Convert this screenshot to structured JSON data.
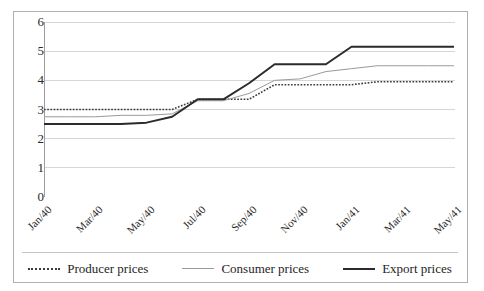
{
  "figure": {
    "top_clipped_text": "",
    "background": "#ffffff",
    "border_color": "#b0b0b0"
  },
  "legend": {
    "position": "bottom",
    "items": [
      {
        "label": "Producer prices",
        "style": "dotted",
        "color": "#3b3b3b",
        "swatch": "line-swatch-dotted"
      },
      {
        "label": "Consumer prices",
        "style": "thin-solid",
        "color": "#9a9a9a",
        "swatch": "line-swatch-thin"
      },
      {
        "label": "Export prices",
        "style": "thick-solid",
        "color": "#2b2b2b",
        "swatch": "line-swatch-thick"
      }
    ]
  },
  "axes": {
    "y_ticks": [
      "6",
      "5",
      "4",
      "3",
      "2",
      "1",
      "0"
    ],
    "x_ticks": [
      "Jan/40",
      "Mar/40",
      "May/40",
      "Jul/40",
      "Sep/40",
      "Nov/40",
      "Jan/41",
      "Mar/41",
      "May/41"
    ]
  },
  "chart_data": {
    "type": "line",
    "title": "",
    "xlabel": "",
    "ylabel": "",
    "ylim": [
      0,
      6
    ],
    "ytick_step": 1,
    "grid": true,
    "grid_axis": "y",
    "legend_position": "bottom",
    "x": [
      "Jan/40",
      "Feb/40",
      "Mar/40",
      "Apr/40",
      "May/40",
      "Jun/40",
      "Jul/40",
      "Aug/40",
      "Sep/40",
      "Oct/40",
      "Nov/40",
      "Dec/40",
      "Jan/41",
      "Feb/41",
      "Mar/41",
      "Apr/41",
      "May/41"
    ],
    "x_tick_labels": [
      "Jan/40",
      "Mar/40",
      "May/40",
      "Jul/40",
      "Sep/40",
      "Nov/40",
      "Jan/41",
      "Mar/41",
      "May/41"
    ],
    "series": [
      {
        "name": "Producer prices",
        "color": "#3b3b3b",
        "style": "dotted",
        "values": [
          3.0,
          3.0,
          3.0,
          3.0,
          3.0,
          3.0,
          3.35,
          3.35,
          3.35,
          3.85,
          3.85,
          3.85,
          3.85,
          3.95,
          3.95,
          3.95,
          3.95
        ]
      },
      {
        "name": "Consumer prices",
        "color": "#9a9a9a",
        "style": "thin-solid",
        "values": [
          2.75,
          2.75,
          2.75,
          2.8,
          2.8,
          2.85,
          3.3,
          3.3,
          3.55,
          4.0,
          4.05,
          4.3,
          4.4,
          4.5,
          4.5,
          4.5,
          4.5
        ]
      },
      {
        "name": "Export prices",
        "color": "#2b2b2b",
        "style": "thick-solid",
        "values": [
          2.5,
          2.5,
          2.5,
          2.5,
          2.55,
          2.75,
          3.35,
          3.35,
          3.9,
          4.55,
          4.55,
          4.55,
          5.15,
          5.15,
          5.15,
          5.15,
          5.15
        ]
      }
    ]
  }
}
